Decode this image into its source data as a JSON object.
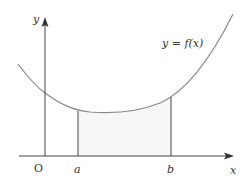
{
  "diagram": {
    "curve_label": "y = f(x)",
    "y_axis_label": "y",
    "x_axis_label": "x",
    "origin_label": "O",
    "lower_bound_label": "a",
    "upper_bound_label": "b",
    "colors": {
      "axis": "#444444",
      "curve": "#888888",
      "region_fill": "#f7f7f7",
      "text": "#333333"
    }
  }
}
